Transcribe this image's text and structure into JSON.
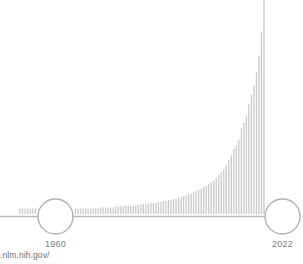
{
  "figure": {
    "name": "exponential-growth-bar-chart",
    "background_color": "#ffffff",
    "bar_color": "#c9c9c9",
    "baseline_color": "#b8b8b8",
    "marker_color": "#b0b0b0",
    "label_color": "#7d7d7d"
  },
  "source": {
    "text": ".nlm.nih.gov/"
  },
  "markers": [
    {
      "name": "marker-1960",
      "label": "1960",
      "cx": 55.5,
      "cy": 216.5,
      "r": 17.5
    },
    {
      "name": "marker-2022",
      "label": "2022",
      "cx": 282.5,
      "cy": 216.5,
      "r": 17.5
    }
  ],
  "chart_data": {
    "type": "bar",
    "title": "",
    "subtitle": "",
    "xlabel": "",
    "ylabel": "",
    "grid": false,
    "legend": null,
    "annotations": [
      {
        "text": "1960",
        "x": 1960
      },
      {
        "text": "2022",
        "x": 2022
      }
    ],
    "axis": {
      "baseline_y": 214,
      "x_pixel_start": 0,
      "x_pixel_end": 295,
      "xlim": [
        1947,
        2022
      ],
      "ylim": [
        0,
        230
      ]
    },
    "tick_labels": [
      "1960",
      "2022"
    ],
    "bar_width_px": 1.3,
    "categories": [
      1947,
      1948,
      1949,
      1950,
      1951,
      1952,
      1953,
      1954,
      1955,
      1956,
      1957,
      1958,
      1959,
      1960,
      1961,
      1962,
      1963,
      1964,
      1965,
      1966,
      1967,
      1968,
      1969,
      1970,
      1971,
      1972,
      1973,
      1974,
      1975,
      1976,
      1977,
      1978,
      1979,
      1980,
      1981,
      1982,
      1983,
      1984,
      1985,
      1986,
      1987,
      1988,
      1989,
      1990,
      1991,
      1992,
      1993,
      1994,
      1995,
      1996,
      1997,
      1998,
      1999,
      2000,
      2001,
      2002,
      2003,
      2004,
      2005,
      2006,
      2007,
      2008,
      2009,
      2010,
      2011,
      2012,
      2013,
      2014,
      2015,
      2016,
      2017,
      2018,
      2019,
      2020,
      2021,
      2022
    ],
    "values": [
      6,
      6,
      6,
      6,
      6,
      6,
      6,
      6,
      6,
      6,
      7,
      7,
      7,
      7,
      7,
      7,
      8,
      8,
      8,
      8,
      9,
      9,
      9,
      9,
      10,
      10,
      10,
      11,
      11,
      11,
      12,
      12,
      12,
      13,
      13,
      14,
      14,
      15,
      15,
      16,
      16,
      17,
      18,
      19,
      20,
      21,
      22,
      23,
      25,
      26,
      27,
      29,
      30,
      32,
      34,
      36,
      39,
      42,
      45,
      48,
      52,
      58,
      63,
      70,
      74,
      80,
      92,
      98,
      105,
      118,
      128,
      138,
      152,
      170,
      196,
      230
    ],
    "leading_bars": {
      "note": "short stub bars left of the 1960 marker",
      "count": 7,
      "values": [
        6,
        6,
        6,
        6,
        6,
        6,
        6
      ]
    }
  }
}
